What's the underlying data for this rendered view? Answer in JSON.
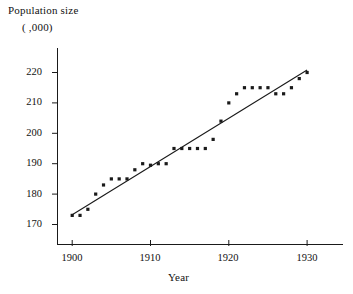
{
  "chart_data": {
    "type": "scatter",
    "title": "",
    "ylabel": "Population size",
    "ylabel_units": "( ,000)",
    "xlabel": "Year",
    "xlim": [
      1898,
      1935
    ],
    "ylim": [
      165,
      224
    ],
    "xticks": [
      1900,
      1910,
      1920,
      1930
    ],
    "yticks": [
      170,
      180,
      190,
      200,
      210,
      220
    ],
    "grid": false,
    "legend": null,
    "marker": "filled-square-dot",
    "marker_color": "#1a1a1a",
    "line_color": "#1a1a1a",
    "x": [
      1900,
      1901,
      1902,
      1903,
      1904,
      1905,
      1906,
      1907,
      1908,
      1909,
      1910,
      1911,
      1912,
      1913,
      1914,
      1915,
      1916,
      1917,
      1918,
      1919,
      1920,
      1921,
      1922,
      1923,
      1924,
      1925,
      1926,
      1927,
      1928,
      1929,
      1930
    ],
    "y": [
      173,
      173,
      175,
      180,
      183,
      185,
      185,
      185,
      188,
      190,
      189.5,
      190,
      190,
      195,
      195,
      195,
      195,
      195,
      198,
      204,
      210,
      213,
      215,
      215,
      215,
      215,
      213,
      213,
      215,
      218,
      220
    ],
    "series": [
      {
        "name": "Population observations",
        "type": "scatter",
        "values": [
          173,
          173,
          175,
          180,
          183,
          185,
          185,
          185,
          188,
          190,
          189.5,
          190,
          190,
          195,
          195,
          195,
          195,
          195,
          198,
          204,
          210,
          213,
          215,
          215,
          215,
          215,
          213,
          213,
          215,
          218,
          220
        ]
      },
      {
        "name": "Least squares regression line",
        "type": "line",
        "endpoints": [
          [
            1900,
            173.2
          ],
          [
            1930,
            220.8
          ]
        ]
      }
    ]
  },
  "axes": {
    "y_axis_title_line1": "Population size",
    "y_axis_title_line2": "( ,000)",
    "x_axis_title": "Year",
    "y_tick_labels": [
      "220",
      "210",
      "200",
      "190",
      "180",
      "170"
    ],
    "x_tick_labels": [
      "1900",
      "1910",
      "1920",
      "1930"
    ]
  }
}
